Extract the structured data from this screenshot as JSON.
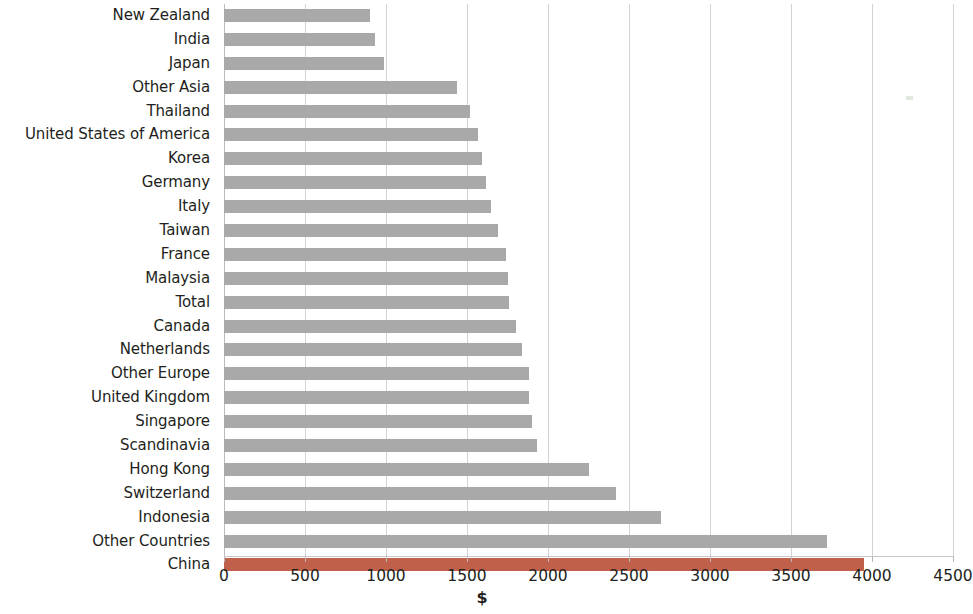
{
  "chart_data": {
    "type": "bar",
    "orientation": "horizontal",
    "title": "",
    "subtitle": "",
    "xlabel": "$",
    "ylabel": "",
    "xlim": [
      0,
      4500
    ],
    "xticks": [
      0,
      500,
      1000,
      1500,
      2000,
      2500,
      3000,
      3500,
      4000,
      4500
    ],
    "xtick_labels": [
      "0",
      "500",
      "1000",
      "1500",
      "2000",
      "2500",
      "3000",
      "3500",
      "4000",
      "4500"
    ],
    "grid": true,
    "grid_axis": "x",
    "legend": null,
    "categories": [
      "New Zealand",
      "India",
      "Japan",
      "Other Asia",
      "Thailand",
      "United States of America",
      "Korea",
      "Germany",
      "Italy",
      "Taiwan",
      "France",
      "Malaysia",
      "Total",
      "Canada",
      "Netherlands",
      "Other Europe",
      "United Kingdom",
      "Singapore",
      "Scandinavia",
      "Hong Kong",
      "Switzerland",
      "Indonesia",
      "Other Countries",
      "China"
    ],
    "values": [
      900,
      930,
      990,
      1440,
      1520,
      1570,
      1590,
      1620,
      1650,
      1690,
      1740,
      1750,
      1760,
      1800,
      1840,
      1880,
      1885,
      1900,
      1930,
      2250,
      2420,
      2700,
      3720,
      3950
    ],
    "highlight_category": "China",
    "colors": {
      "bar": "#a9a9a9",
      "highlight_bar": "#c0604a",
      "gridline": "#d5d3d1",
      "text": "#231f20",
      "background": "#ffffff"
    }
  }
}
